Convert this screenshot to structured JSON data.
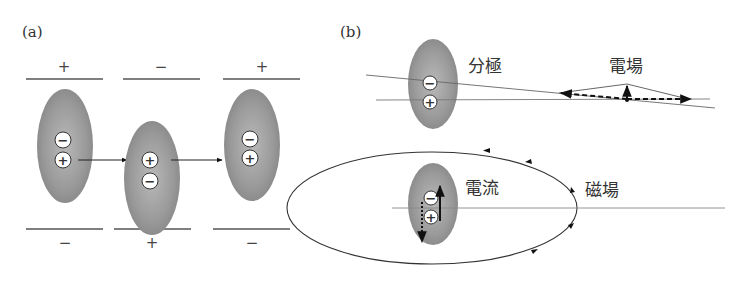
{
  "panel_a": {
    "label": "(a)",
    "top_signs": [
      "+",
      "−",
      "+"
    ],
    "bottom_signs": [
      "−",
      "+",
      "−"
    ],
    "molecules": [
      {
        "charges": [
          "−",
          "+"
        ]
      },
      {
        "charges": [
          "+",
          "−"
        ]
      },
      {
        "charges": [
          "−",
          "+"
        ]
      }
    ]
  },
  "panel_b": {
    "label": "(b)",
    "polarization_label": "分極",
    "electric_field_label": "電場",
    "current_label": "電流",
    "magnetic_field_label": "磁場",
    "top_molecule": {
      "charges": [
        "−",
        "+"
      ]
    },
    "bottom_molecule": {
      "charges": [
        "−",
        "+"
      ]
    }
  },
  "colors": {
    "ellipse_center": "#b8b8b8",
    "ellipse_edge": "#8a8a8a",
    "line": "#555555",
    "arrow": "#111111"
  }
}
